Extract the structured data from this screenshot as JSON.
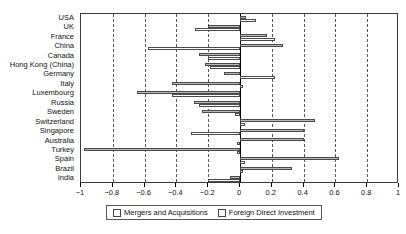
{
  "chart_data": {
    "type": "bar",
    "orientation": "horizontal",
    "title": "",
    "xlabel": "",
    "ylabel": "",
    "xlim": [
      -1,
      1
    ],
    "xticks": [
      -1,
      -0.8,
      -0.6,
      -0.4,
      -0.2,
      0,
      0.2,
      0.4,
      0.6,
      0.8,
      1
    ],
    "xticklabels": [
      "−1",
      "−0.8",
      "−0.6",
      "−0.4",
      "−0.2",
      "0",
      "0.2",
      "0.4",
      "0.6",
      "0.8",
      "1"
    ],
    "grid": true,
    "grid_axis": "x",
    "grid_style": "dashed",
    "zero_line": true,
    "legend_position": "bottom",
    "categories": [
      "USA",
      "UK",
      "France",
      "China",
      "Canada",
      "Hong  Kong (China)",
      "Germany",
      "Italy",
      "Luxembourg",
      "Russia",
      "Sweden",
      "Switzerland",
      "Singapore",
      "Australia",
      "Turkey",
      "Spain",
      "Brazil",
      "India"
    ],
    "series": [
      {
        "name": "Mergers and Acquisitions",
        "color": "#b8b8b8",
        "values": [
          0.04,
          -0.2,
          0.17,
          0.27,
          -0.26,
          -0.22,
          -0.1,
          -0.43,
          -0.65,
          -0.29,
          -0.24,
          0.47,
          0.4,
          0.4,
          -0.98,
          0.62,
          0.33,
          -0.06
        ]
      },
      {
        "name": "Foreign Direct Investment",
        "color": "#ffffff",
        "values": [
          0.1,
          -0.28,
          0.22,
          -0.58,
          -0.2,
          -0.19,
          0.22,
          0.02,
          -0.43,
          -0.26,
          -0.03,
          0.03,
          -0.31,
          -0.02,
          -0.02,
          0.03,
          0.02,
          -0.2
        ]
      }
    ]
  },
  "legend": {
    "items": [
      {
        "label": "Mergers and Acquisitions"
      },
      {
        "label": "Foreign Direct Investment"
      }
    ]
  }
}
